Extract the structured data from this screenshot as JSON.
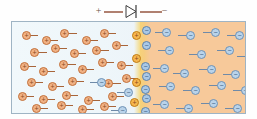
{
  "diagram": {
    "circuit": {
      "positive_terminal_label": "+",
      "negative_terminal_label": "−",
      "diode_symbol_name": "diode-symbol",
      "wire_color": "#b08070",
      "symbol_color": "#6b5047"
    },
    "regions": {
      "p_type": {
        "name": "p-type region",
        "color": "#f1f8fb",
        "majority_carrier": "hole",
        "carrier_symbol": "+"
      },
      "n_type": {
        "name": "n-type region",
        "color": "#f7c99a",
        "majority_carrier": "electron",
        "carrier_symbol": "−"
      },
      "junction": {
        "name": "junction recombination zone",
        "color": "#f6d66e",
        "x_center_px": 130
      }
    },
    "legend": {
      "hole_fill": "#f0b184",
      "hole_stroke": "#c2713c",
      "electron_fill": "#b9d3ea",
      "electron_stroke": "#6f92b5",
      "highlight_fill": "#f6b64e"
    },
    "carriers": [
      {
        "t": "hole",
        "x": 10,
        "y": 9,
        "dir": 1,
        "len": 8,
        "hot": false
      },
      {
        "t": "hole",
        "x": 30,
        "y": 14,
        "dir": 1,
        "len": 8,
        "hot": false
      },
      {
        "t": "hole",
        "x": 48,
        "y": 7,
        "dir": 1,
        "len": 9,
        "hot": false
      },
      {
        "t": "hole",
        "x": 70,
        "y": 14,
        "dir": 1,
        "len": 8,
        "hot": false
      },
      {
        "t": "hole",
        "x": 88,
        "y": 7,
        "dir": 1,
        "len": 8,
        "hot": false
      },
      {
        "t": "hole",
        "x": 18,
        "y": 26,
        "dir": 1,
        "len": 9,
        "hot": false
      },
      {
        "t": "hole",
        "x": 39,
        "y": 22,
        "dir": 1,
        "len": 8,
        "hot": false
      },
      {
        "t": "hole",
        "x": 58,
        "y": 27,
        "dir": 1,
        "len": 8,
        "hot": false
      },
      {
        "t": "hole",
        "x": 80,
        "y": 24,
        "dir": 1,
        "len": 9,
        "hot": false
      },
      {
        "t": "hole",
        "x": 100,
        "y": 19,
        "dir": 1,
        "len": 8,
        "hot": false
      },
      {
        "t": "hole",
        "x": 8,
        "y": 40,
        "dir": 1,
        "len": 8,
        "hot": false
      },
      {
        "t": "hole",
        "x": 27,
        "y": 45,
        "dir": 1,
        "len": 8,
        "hot": false
      },
      {
        "t": "hole",
        "x": 47,
        "y": 38,
        "dir": 1,
        "len": 9,
        "hot": false
      },
      {
        "t": "hole",
        "x": 66,
        "y": 43,
        "dir": 1,
        "len": 8,
        "hot": false
      },
      {
        "t": "hole",
        "x": 86,
        "y": 36,
        "dir": 1,
        "len": 8,
        "hot": false
      },
      {
        "t": "hole",
        "x": 105,
        "y": 39,
        "dir": 1,
        "len": 8,
        "hot": false
      },
      {
        "t": "hole",
        "x": 15,
        "y": 56,
        "dir": 1,
        "len": 8,
        "hot": false
      },
      {
        "t": "hole",
        "x": 36,
        "y": 60,
        "dir": 1,
        "len": 8,
        "hot": false
      },
      {
        "t": "hole",
        "x": 56,
        "y": 55,
        "dir": 1,
        "len": 8,
        "hot": false
      },
      {
        "t": "hole",
        "x": 92,
        "y": 57,
        "dir": 1,
        "len": 9,
        "hot": false
      },
      {
        "t": "hole",
        "x": 110,
        "y": 52,
        "dir": 1,
        "len": 8,
        "hot": false
      },
      {
        "t": "hole",
        "x": 6,
        "y": 70,
        "dir": 1,
        "len": 8,
        "hot": false
      },
      {
        "t": "hole",
        "x": 27,
        "y": 73,
        "dir": 1,
        "len": 8,
        "hot": false
      },
      {
        "t": "hole",
        "x": 50,
        "y": 69,
        "dir": 1,
        "len": 8,
        "hot": false
      },
      {
        "t": "hole",
        "x": 72,
        "y": 74,
        "dir": 1,
        "len": 8,
        "hot": false
      },
      {
        "t": "hole",
        "x": 96,
        "y": 70,
        "dir": 1,
        "len": 8,
        "hot": false
      },
      {
        "t": "hole",
        "x": 20,
        "y": 82,
        "dir": 1,
        "len": 8,
        "hot": false
      },
      {
        "t": "hole",
        "x": 45,
        "y": 79,
        "dir": 1,
        "len": 8,
        "hot": false
      },
      {
        "t": "hole",
        "x": 66,
        "y": 83,
        "dir": 1,
        "len": 8,
        "hot": false
      },
      {
        "t": "hole",
        "x": 88,
        "y": 80,
        "dir": 1,
        "len": 8,
        "hot": false
      },
      {
        "t": "hole",
        "x": 14,
        "y": 96,
        "dir": 1,
        "len": 9,
        "hot": false
      },
      {
        "t": "hole",
        "x": 40,
        "y": 96,
        "dir": 1,
        "len": 9,
        "hot": false
      },
      {
        "t": "hole",
        "x": 68,
        "y": 96,
        "dir": 1,
        "len": 9,
        "hot": false
      },
      {
        "t": "hole",
        "x": 98,
        "y": 95,
        "dir": 1,
        "len": 9,
        "hot": false
      },
      {
        "t": "electron",
        "x": 77,
        "y": 56,
        "dir": -1,
        "len": 8,
        "hot": false
      },
      {
        "t": "electron",
        "x": 98,
        "y": 84,
        "dir": -1,
        "len": 8,
        "hot": false
      },
      {
        "t": "electron",
        "x": 104,
        "y": 66,
        "dir": -1,
        "len": 8,
        "hot": false
      },
      {
        "t": "hole",
        "x": 120,
        "y": 9,
        "dir": 1,
        "len": 0,
        "hot": true
      },
      {
        "t": "hole",
        "x": 120,
        "y": 32,
        "dir": 1,
        "len": 0,
        "hot": true
      },
      {
        "t": "hole",
        "x": 120,
        "y": 56,
        "dir": 1,
        "len": 0,
        "hot": true
      },
      {
        "t": "hole",
        "x": 118,
        "y": 76,
        "dir": 1,
        "len": 0,
        "hot": true
      },
      {
        "t": "hole",
        "x": 120,
        "y": 92,
        "dir": 1,
        "len": 0,
        "hot": true
      },
      {
        "t": "electron",
        "x": 130,
        "y": 4,
        "dir": -1,
        "len": 0,
        "hot": true
      },
      {
        "t": "electron",
        "x": 130,
        "y": 19,
        "dir": -1,
        "len": 0,
        "hot": true
      },
      {
        "t": "electron",
        "x": 129,
        "y": 40,
        "dir": -1,
        "len": 0,
        "hot": true
      },
      {
        "t": "electron",
        "x": 130,
        "y": 50,
        "dir": -1,
        "len": 0,
        "hot": true
      },
      {
        "t": "electron",
        "x": 129,
        "y": 63,
        "dir": -1,
        "len": 0,
        "hot": true
      },
      {
        "t": "electron",
        "x": 130,
        "y": 72,
        "dir": -1,
        "len": 0,
        "hot": true
      },
      {
        "t": "electron",
        "x": 129,
        "y": 85,
        "dir": -1,
        "len": 0,
        "hot": true
      },
      {
        "t": "electron",
        "x": 130,
        "y": 99,
        "dir": -1,
        "len": 0,
        "hot": true
      },
      {
        "t": "electron",
        "x": 142,
        "y": 6,
        "dir": -1,
        "len": 8,
        "hot": false
      },
      {
        "t": "electron",
        "x": 165,
        "y": 9,
        "dir": -1,
        "len": 9,
        "hot": false
      },
      {
        "t": "electron",
        "x": 190,
        "y": 6,
        "dir": -1,
        "len": 9,
        "hot": false
      },
      {
        "t": "electron",
        "x": 214,
        "y": 9,
        "dir": -1,
        "len": 9,
        "hot": false
      },
      {
        "t": "electron",
        "x": 145,
        "y": 24,
        "dir": -1,
        "len": 8,
        "hot": false
      },
      {
        "t": "electron",
        "x": 176,
        "y": 28,
        "dir": -1,
        "len": 9,
        "hot": false
      },
      {
        "t": "electron",
        "x": 204,
        "y": 24,
        "dir": -1,
        "len": 9,
        "hot": false
      },
      {
        "t": "electron",
        "x": 224,
        "y": 30,
        "dir": -1,
        "len": 9,
        "hot": false
      },
      {
        "t": "electron",
        "x": 140,
        "y": 42,
        "dir": -1,
        "len": 8,
        "hot": false
      },
      {
        "t": "electron",
        "x": 160,
        "y": 47,
        "dir": -1,
        "len": 8,
        "hot": false
      },
      {
        "t": "electron",
        "x": 186,
        "y": 43,
        "dir": -1,
        "len": 9,
        "hot": false
      },
      {
        "t": "electron",
        "x": 210,
        "y": 48,
        "dir": -1,
        "len": 9,
        "hot": false
      },
      {
        "t": "electron",
        "x": 146,
        "y": 60,
        "dir": -1,
        "len": 8,
        "hot": false
      },
      {
        "t": "electron",
        "x": 170,
        "y": 64,
        "dir": -1,
        "len": 9,
        "hot": false
      },
      {
        "t": "electron",
        "x": 196,
        "y": 59,
        "dir": -1,
        "len": 9,
        "hot": false
      },
      {
        "t": "electron",
        "x": 220,
        "y": 64,
        "dir": -1,
        "len": 9,
        "hot": false
      },
      {
        "t": "electron",
        "x": 140,
        "y": 78,
        "dir": -1,
        "len": 8,
        "hot": false
      },
      {
        "t": "electron",
        "x": 163,
        "y": 82,
        "dir": -1,
        "len": 9,
        "hot": false
      },
      {
        "t": "electron",
        "x": 188,
        "y": 77,
        "dir": -1,
        "len": 9,
        "hot": false
      },
      {
        "t": "electron",
        "x": 212,
        "y": 82,
        "dir": -1,
        "len": 9,
        "hot": false
      },
      {
        "t": "electron",
        "x": 148,
        "y": 95,
        "dir": -1,
        "len": 9,
        "hot": false
      },
      {
        "t": "electron",
        "x": 174,
        "y": 97,
        "dir": -1,
        "len": 9,
        "hot": false
      },
      {
        "t": "electron",
        "x": 200,
        "y": 94,
        "dir": -1,
        "len": 9,
        "hot": false
      },
      {
        "t": "electron",
        "x": 222,
        "y": 97,
        "dir": -1,
        "len": 9,
        "hot": false
      }
    ]
  }
}
